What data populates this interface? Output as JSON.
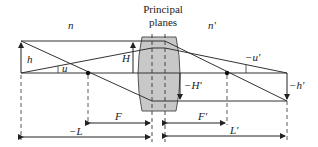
{
  "title": {
    "line1": "Principal",
    "line2": "planes"
  },
  "media": {
    "object_index": "n",
    "image_index": "n'"
  },
  "labels": {
    "object_height": "h",
    "object_angle": "u",
    "principal_height": "H",
    "image_principal_height": "−H'",
    "image_height": "−h'",
    "image_angle": "−u'",
    "front_focal": "F",
    "back_focal": "F'",
    "object_distance": "−L",
    "image_distance": "L'"
  },
  "colors": {
    "lens_fill": "#c8c8c8",
    "line": "#333333",
    "background": "#ffffff"
  }
}
